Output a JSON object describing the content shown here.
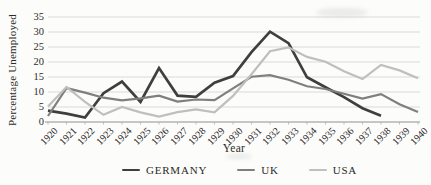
{
  "chart_data": {
    "type": "line",
    "title": "",
    "xlabel": "Year",
    "ylabel": "Percentage Unemployed",
    "x": [
      1920,
      1921,
      1922,
      1923,
      1924,
      1925,
      1926,
      1927,
      1928,
      1929,
      1930,
      1931,
      1932,
      1933,
      1934,
      1935,
      1936,
      1937,
      1938,
      1939,
      1940
    ],
    "ylim": [
      0,
      35
    ],
    "yticks": [
      0,
      5,
      10,
      15,
      20,
      25,
      30,
      35
    ],
    "grid": true,
    "legend_position": "bottom",
    "grid_color": "#dadada",
    "axis_color": "#8f8f8f",
    "tick_color": "#b5b5b5",
    "text_color": "#2a2a2a",
    "series": [
      {
        "name": "GERMANY",
        "color": "#3f3f3f",
        "width": 2.7,
        "values": [
          3.8,
          2.8,
          1.5,
          9.6,
          13.5,
          6.7,
          18.0,
          8.8,
          8.4,
          13.1,
          15.3,
          23.3,
          30.1,
          26.3,
          14.9,
          11.6,
          8.3,
          4.6,
          2.1,
          null,
          null
        ]
      },
      {
        "name": "UK",
        "color": "#7f7f7f",
        "width": 2.2,
        "values": [
          2.0,
          11.3,
          9.8,
          8.1,
          7.2,
          7.9,
          8.8,
          6.8,
          7.5,
          7.3,
          11.2,
          15.1,
          15.6,
          14.1,
          11.9,
          11.0,
          9.4,
          7.8,
          9.3,
          5.9,
          3.3
        ]
      },
      {
        "name": "USA",
        "color": "#bfbfbf",
        "width": 2.2,
        "values": [
          5.2,
          11.7,
          6.7,
          2.4,
          5.0,
          3.2,
          1.8,
          3.3,
          4.2,
          3.2,
          8.7,
          15.9,
          23.6,
          24.9,
          21.7,
          20.1,
          16.9,
          14.3,
          19.0,
          17.2,
          14.6
        ]
      }
    ]
  },
  "legend": {
    "items": [
      {
        "label": "GERMANY"
      },
      {
        "label": "UK"
      },
      {
        "label": "USA"
      }
    ]
  }
}
